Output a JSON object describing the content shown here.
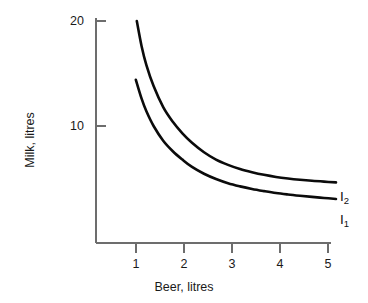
{
  "chart_data": {
    "type": "line",
    "title": "",
    "subtitle": "",
    "xlabel": "Beer, litres",
    "ylabel": "Milk, litres",
    "xlim": [
      0,
      5.05
    ],
    "ylim": [
      0,
      21.5
    ],
    "xticks": [
      1,
      2,
      3,
      4,
      5
    ],
    "xticklabels": [
      "1",
      "2",
      "3",
      "4",
      "5"
    ],
    "yticks": [
      10,
      20
    ],
    "yticklabels": [
      "10",
      "20"
    ],
    "grid": false,
    "legend_position": "inline-right",
    "series": [
      {
        "name": "I2",
        "label": "I",
        "subscript": "2",
        "color": "#0b0b0b",
        "annotation": "I2",
        "x": [
          0.85,
          0.95,
          1.05,
          1.2,
          1.4,
          1.6,
          1.8,
          2.0,
          2.25,
          2.5,
          2.75,
          3.0,
          3.25,
          3.5,
          3.75,
          4.0,
          4.25,
          4.5,
          4.75,
          5.0
        ],
        "y": [
          20.0,
          17.6,
          15.8,
          13.8,
          11.8,
          10.4,
          9.3,
          8.4,
          7.5,
          6.8,
          6.3,
          5.9,
          5.6,
          5.35,
          5.15,
          5.0,
          4.88,
          4.78,
          4.7,
          4.63
        ]
      },
      {
        "name": "I1",
        "label": "I",
        "subscript": "1",
        "color": "#0b0b0b",
        "annotation": "I1",
        "x": [
          0.83,
          0.95,
          1.05,
          1.2,
          1.4,
          1.6,
          1.8,
          2.0,
          2.25,
          2.5,
          2.75,
          3.0,
          3.25,
          3.5,
          3.75,
          4.0,
          4.25,
          4.5,
          4.75,
          5.0
        ],
        "y": [
          14.4,
          12.6,
          11.4,
          10.0,
          8.6,
          7.6,
          6.8,
          6.1,
          5.45,
          4.95,
          4.55,
          4.25,
          4.0,
          3.8,
          3.62,
          3.48,
          3.36,
          3.25,
          3.15,
          3.05
        ]
      }
    ]
  },
  "axes": {
    "x_title": "Beer, litres",
    "y_title": "Milk, litres",
    "x_tick_labels": [
      "1",
      "2",
      "3",
      "4",
      "5"
    ],
    "y_tick_labels": [
      "20",
      "10"
    ]
  },
  "annotations": {
    "upper_curve_base": "I",
    "upper_curve_sub": "2",
    "lower_curve_base": "I",
    "lower_curve_sub": "1"
  },
  "colors": {
    "background": "#ffffff",
    "curve": "#0b0b0b",
    "axis": "#6d6d6d",
    "text": "#1a1a1a"
  }
}
